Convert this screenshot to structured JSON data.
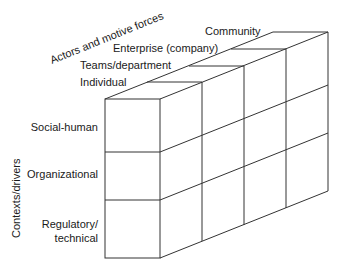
{
  "diagram": {
    "axes": {
      "depth_axis_title": "Actors and motive forces",
      "vertical_axis_title": "Contexts/drivers"
    },
    "actors": [
      {
        "label": "Individual"
      },
      {
        "label": "Teams/department"
      },
      {
        "label": "Enterprise (company)"
      },
      {
        "label": "Community"
      }
    ],
    "contexts": [
      {
        "label": "Social-human"
      },
      {
        "label": "Organizational"
      },
      {
        "label_line1": "Regulatory/",
        "label_line2": "technical"
      }
    ],
    "colors": {
      "line": "#333333",
      "text": "#1a1a1a",
      "background": "#ffffff"
    }
  }
}
